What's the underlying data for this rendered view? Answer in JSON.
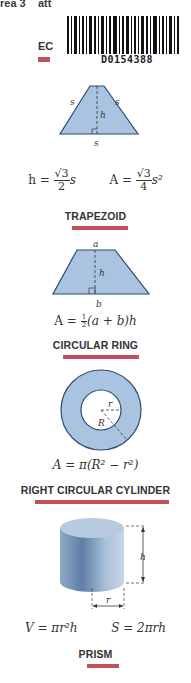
{
  "page": {
    "top_cut_text": "rea 3    att",
    "top_heading_fragment": "EC",
    "barcode": {
      "code": "D0154388"
    },
    "accent_color": "#c0505a",
    "shape_fill_color": "#a9c3e0",
    "shape_stroke_color": "#2d4d75"
  },
  "sections": {
    "equilateral_triangle": {
      "labels": {
        "left_side": "s",
        "right_side": "s",
        "height": "h",
        "base": "s"
      },
      "formula_h": {
        "lhs": "h =",
        "num": "√3",
        "den": "2",
        "var": "s"
      },
      "formula_a": {
        "lhs": "A =",
        "num": "√3",
        "den": "4",
        "var": "s²"
      }
    },
    "trapezoid": {
      "title": "TRAPEZOID",
      "labels": {
        "top": "a",
        "height": "h",
        "bottom": "b"
      },
      "formula": {
        "lhs": "A =",
        "num": "1",
        "den": "2",
        "rest": "(a + b)h"
      }
    },
    "circular_ring": {
      "title": "CIRCULAR RING",
      "labels": {
        "inner_radius": "r",
        "outer_radius": "R"
      },
      "formula": "A = π(R² − r²)"
    },
    "right_circular_cylinder": {
      "title": "RIGHT CIRCULAR CYLINDER",
      "labels": {
        "height": "h",
        "radius": "r"
      },
      "formula_v": "V = πr²h",
      "formula_s": "S = 2πrh"
    },
    "prism": {
      "title": "PRISM"
    }
  }
}
